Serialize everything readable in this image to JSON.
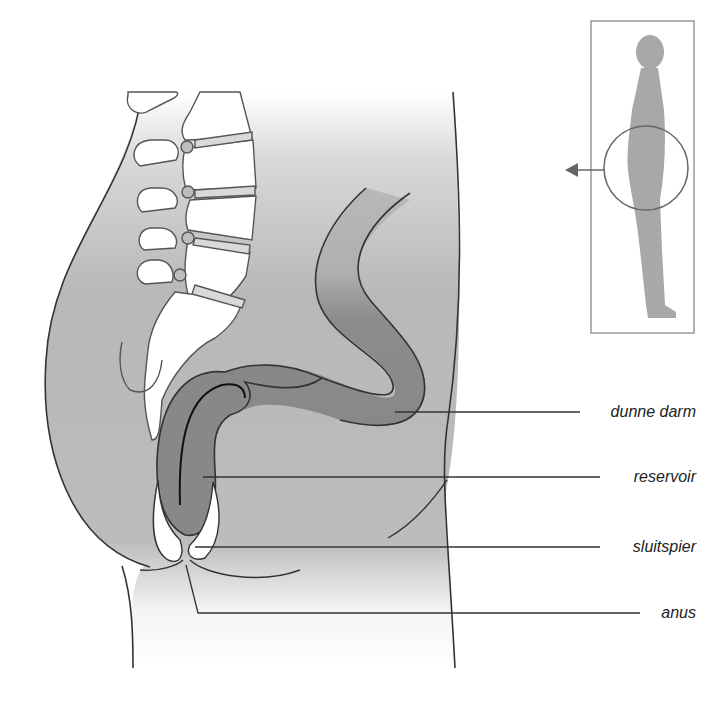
{
  "diagram": {
    "type": "anatomical-cross-section",
    "labels": [
      {
        "id": "small-intestine",
        "text": "dunne darm"
      },
      {
        "id": "reservoir",
        "text": "reservoir"
      },
      {
        "id": "sphincter",
        "text": "sluitspier"
      },
      {
        "id": "anus",
        "text": "anus"
      }
    ],
    "inset": {
      "description": "standing human silhouette with circle around pelvis and arrow pointing left"
    },
    "colors": {
      "body_fill": "#b4b4b4",
      "intestine_fill": "#8a8a8a",
      "outline": "#333333",
      "bone_fill": "#ffffff",
      "silhouette": "#a8a8a8"
    }
  }
}
